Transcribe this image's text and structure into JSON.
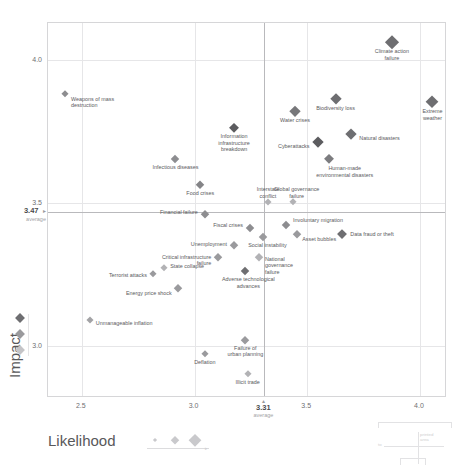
{
  "chart_data": {
    "type": "scatter",
    "title": "",
    "xlabel": "Likelihood",
    "ylabel": "Impact",
    "xlim": [
      2.35,
      4.12
    ],
    "ylim": [
      2.82,
      4.13
    ],
    "xticks": [
      "2.5",
      "3.0",
      "3.5",
      "4.0"
    ],
    "xtick_values": [
      2.5,
      3.0,
      3.5,
      4.0
    ],
    "yticks": [
      "4.0",
      "3.5",
      "3.0"
    ],
    "ytick_values": [
      4.0,
      3.5,
      3.0
    ],
    "grid": true,
    "legend_position": "bottom-left",
    "x_average": 3.31,
    "x_average_label": "3.31",
    "x_average_sub": "average",
    "y_average": 3.47,
    "y_average_label": "3.47",
    "y_average_sub": "average",
    "y_average_arrow": "▸",
    "x_average_arrow": "▴",
    "points": [
      {
        "label": "Climate action\nfailure",
        "x": 3.88,
        "y": 4.06,
        "size": 13.5,
        "color": "#6e6e71",
        "lpos": "c",
        "ldx": 0,
        "ldy": 9
      },
      {
        "label": "Extreme weather",
        "x": 4.06,
        "y": 3.85,
        "size": 13.0,
        "color": "#6e6e71",
        "lpos": "c",
        "ldx": 0,
        "ldy": 9
      },
      {
        "label": "Biodiversity loss",
        "x": 3.63,
        "y": 3.86,
        "size": 11.5,
        "color": "#6e6e71",
        "lpos": "c",
        "ldx": 0,
        "ldy": 9
      },
      {
        "label": "Water crises",
        "x": 3.45,
        "y": 3.82,
        "size": 10.5,
        "color": "#77777a",
        "lpos": "c",
        "ldx": 0,
        "ldy": 9
      },
      {
        "label": "Natural disasters",
        "x": 3.7,
        "y": 3.74,
        "size": 11.0,
        "color": "#6e6e71",
        "lpos": "l",
        "ldx": 8,
        "ldy": 4
      },
      {
        "label": "Cyberattacks",
        "x": 3.55,
        "y": 3.71,
        "size": 11.0,
        "color": "#5c5c5f",
        "lpos": "r",
        "ldx": -8,
        "ldy": 4
      },
      {
        "label": "Human-made\nenvironmental disasters",
        "x": 3.6,
        "y": 3.65,
        "size": 10.0,
        "color": "#7c7c7f",
        "lpos": "c",
        "ldx": 16,
        "ldy": 9
      },
      {
        "label": "Information\ninfrastructure\nbreakdown",
        "x": 3.18,
        "y": 3.76,
        "size": 10.0,
        "color": "#5c5c5f",
        "lpos": "c",
        "ldx": 0,
        "ldy": 8
      },
      {
        "label": "Infectious diseases",
        "x": 2.92,
        "y": 3.65,
        "size": 8.5,
        "color": "#8d8d90",
        "lpos": "c",
        "ldx": 0,
        "ldy": 8
      },
      {
        "label": "Food crises",
        "x": 3.03,
        "y": 3.56,
        "size": 9.0,
        "color": "#848487",
        "lpos": "c",
        "ldx": 0,
        "ldy": 8
      },
      {
        "label": "Weapons of mass\ndestruction",
        "x": 2.43,
        "y": 3.88,
        "size": 7.5,
        "color": "#8d8d90",
        "lpos": "l",
        "ldx": 6,
        "ldy": 5
      },
      {
        "label": "Interstate\nconflict",
        "x": 3.33,
        "y": 3.5,
        "size": 7.0,
        "color": "#b2b2b5",
        "lpos": "c",
        "ldx": 0,
        "ldy": -13
      },
      {
        "label": "Global governance\nfailure",
        "x": 3.44,
        "y": 3.5,
        "size": 7.5,
        "color": "#b2b2b5",
        "lpos": "c",
        "ldx": 4,
        "ldy": -13
      },
      {
        "label": "Financial failure",
        "x": 3.05,
        "y": 3.46,
        "size": 8.0,
        "color": "#8d8d90",
        "lpos": "r",
        "ldx": -7,
        "ldy": -2
      },
      {
        "label": "Involuntary migration",
        "x": 3.41,
        "y": 3.42,
        "size": 8.5,
        "color": "#8d8d90",
        "lpos": "l",
        "ldx": 7,
        "ldy": -5
      },
      {
        "label": "Fiscal crises",
        "x": 3.25,
        "y": 3.41,
        "size": 8.5,
        "color": "#8d8d90",
        "lpos": "r",
        "ldx": -7,
        "ldy": -3
      },
      {
        "label": "Asset bubbles",
        "x": 3.46,
        "y": 3.39,
        "size": 8.0,
        "color": "#9a9a9d",
        "lpos": "l",
        "ldx": 5,
        "ldy": 5
      },
      {
        "label": "Data fraud or theft",
        "x": 3.66,
        "y": 3.39,
        "size": 9.5,
        "color": "#6e6e71",
        "lpos": "l",
        "ldx": 8,
        "ldy": 0
      },
      {
        "label": "Social instability",
        "x": 3.31,
        "y": 3.38,
        "size": 8.5,
        "color": "#9a9a9d",
        "lpos": "c",
        "ldx": 4,
        "ldy": 8
      },
      {
        "label": "Unemployment",
        "x": 3.18,
        "y": 3.35,
        "size": 8.0,
        "color": "#9a9a9d",
        "lpos": "r",
        "ldx": -7,
        "ldy": -1
      },
      {
        "label": "National\ngovernance\nfailure",
        "x": 3.29,
        "y": 3.31,
        "size": 8.0,
        "color": "#b2b2b5",
        "lpos": "l",
        "ldx": 6,
        "ldy": 2
      },
      {
        "label": "Critical infrastructure\nfailure",
        "x": 3.11,
        "y": 3.31,
        "size": 8.0,
        "color": "#9a9a9d",
        "lpos": "r",
        "ldx": -7,
        "ldy": 0
      },
      {
        "label": "Adverse technological\nadvances",
        "x": 3.23,
        "y": 3.26,
        "size": 8.5,
        "color": "#6e6e71",
        "lpos": "c",
        "ldx": 3,
        "ldy": 8
      },
      {
        "label": "State collapse",
        "x": 2.87,
        "y": 3.27,
        "size": 7.5,
        "color": "#b2b2b5",
        "lpos": "l",
        "ldx": 6,
        "ldy": -2
      },
      {
        "label": "Terrorist attacks",
        "x": 2.82,
        "y": 3.25,
        "size": 7.5,
        "color": "#9a9a9d",
        "lpos": "r",
        "ldx": -6,
        "ldy": 1
      },
      {
        "label": "Energy price shock",
        "x": 2.93,
        "y": 3.2,
        "size": 8.0,
        "color": "#9a9a9d",
        "lpos": "r",
        "ldx": -6,
        "ldy": 5
      },
      {
        "label": "Unmanageable inflation",
        "x": 2.54,
        "y": 3.09,
        "size": 7.0,
        "color": "#a3a3a6",
        "lpos": "l",
        "ldx": 6,
        "ldy": 3
      },
      {
        "label": "Failure of\nurban planning",
        "x": 3.23,
        "y": 3.02,
        "size": 8.0,
        "color": "#9a9a9d",
        "lpos": "c",
        "ldx": 0,
        "ldy": 8
      },
      {
        "label": "Deflation",
        "x": 3.05,
        "y": 2.97,
        "size": 7.5,
        "color": "#9a9a9d",
        "lpos": "c",
        "ldx": 0,
        "ldy": 8
      },
      {
        "label": "Illicit trade",
        "x": 3.24,
        "y": 2.9,
        "size": 7.5,
        "color": "#b2b2b5",
        "lpos": "c",
        "ldx": 0,
        "ldy": 8
      }
    ],
    "size_legend": {
      "name": "size-legend",
      "steps": [
        3,
        5.5,
        8.5
      ]
    },
    "color_legend": {
      "name": "color-legend",
      "colors": [
        "#6e6e71",
        "#9a9a9d",
        "#c4c4c7"
      ]
    }
  },
  "artifact": {
    "label_top": "printed\narea",
    "label_left": "to"
  }
}
